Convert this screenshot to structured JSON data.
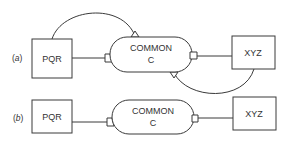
{
  "diagram": {
    "panels": [
      {
        "label_open": "(",
        "label_letter": "a",
        "label_close": ")",
        "left_box": "PQR",
        "center_line1": "COMMON",
        "center_line2": "C",
        "right_box": "XYZ",
        "has_arcs": true
      },
      {
        "label_open": "(",
        "label_letter": "b",
        "label_close": ")",
        "left_box": "PQR",
        "center_line1": "COMMON",
        "center_line2": "C",
        "right_box": "XYZ",
        "has_arcs": false
      }
    ],
    "colors": {
      "stroke": "#3a3a3a",
      "text": "#333333",
      "background": "#ffffff"
    }
  }
}
